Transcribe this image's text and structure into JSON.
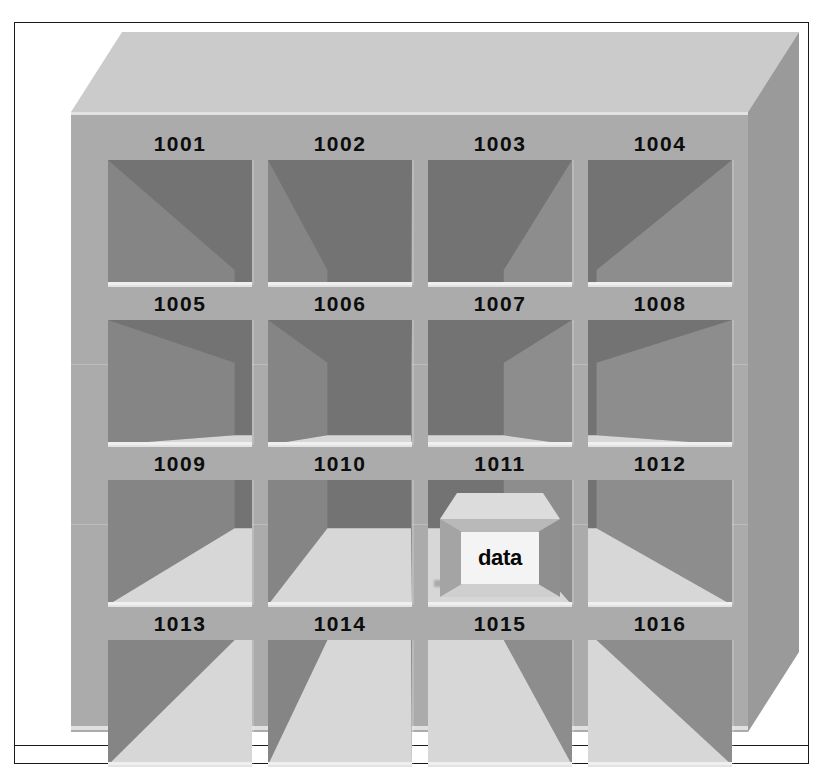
{
  "figure": {
    "rows": 4,
    "columns": 4
  },
  "colors": {
    "cabinet_front": "#ababab",
    "cabinet_top": "#cbcbcb",
    "cabinet_right": "#9a9a9a",
    "bin_back_wall": "#737373",
    "bin_left_wall": "#858585",
    "bin_floor": "#d7d7d7",
    "bin_lip": "#efefef",
    "cube_face": "#f4f4f4",
    "cube_top": "#dcdcdc",
    "cube_body": "#b9b9b9",
    "label_text": "#0d0d0d",
    "frame_border": "#1a1a1a",
    "page_background": "#ffffff"
  },
  "bins": [
    {
      "label": "1001",
      "row": 1,
      "column": 1,
      "occupied": false,
      "contents": ""
    },
    {
      "label": "1002",
      "row": 1,
      "column": 2,
      "occupied": false,
      "contents": ""
    },
    {
      "label": "1003",
      "row": 1,
      "column": 3,
      "occupied": false,
      "contents": ""
    },
    {
      "label": "1004",
      "row": 1,
      "column": 4,
      "occupied": false,
      "contents": ""
    },
    {
      "label": "1005",
      "row": 2,
      "column": 1,
      "occupied": false,
      "contents": ""
    },
    {
      "label": "1006",
      "row": 2,
      "column": 2,
      "occupied": false,
      "contents": ""
    },
    {
      "label": "1007",
      "row": 2,
      "column": 3,
      "occupied": false,
      "contents": ""
    },
    {
      "label": "1008",
      "row": 2,
      "column": 4,
      "occupied": false,
      "contents": ""
    },
    {
      "label": "1009",
      "row": 3,
      "column": 1,
      "occupied": false,
      "contents": ""
    },
    {
      "label": "1010",
      "row": 3,
      "column": 2,
      "occupied": false,
      "contents": ""
    },
    {
      "label": "1011",
      "row": 3,
      "column": 3,
      "occupied": true,
      "contents": "data"
    },
    {
      "label": "1012",
      "row": 3,
      "column": 4,
      "occupied": false,
      "contents": ""
    },
    {
      "label": "1013",
      "row": 4,
      "column": 1,
      "occupied": false,
      "contents": ""
    },
    {
      "label": "1014",
      "row": 4,
      "column": 2,
      "occupied": false,
      "contents": ""
    },
    {
      "label": "1015",
      "row": 4,
      "column": 3,
      "occupied": false,
      "contents": ""
    },
    {
      "label": "1016",
      "row": 4,
      "column": 4,
      "occupied": false,
      "contents": ""
    }
  ],
  "stored_box": {
    "bin_label": "1011",
    "face_text": "data"
  }
}
